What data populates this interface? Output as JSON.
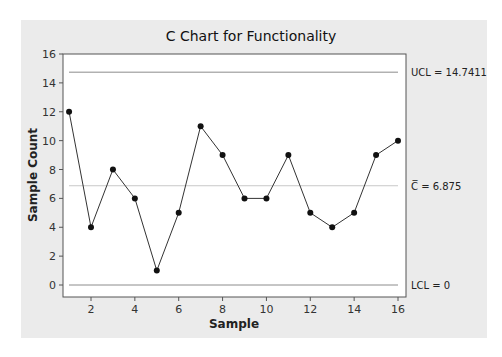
{
  "chart_data": {
    "type": "line",
    "title": "C Chart for Functionality",
    "xlabel": "Sample",
    "ylabel": "Sample Count",
    "x": [
      1,
      2,
      3,
      4,
      5,
      6,
      7,
      8,
      9,
      10,
      11,
      12,
      13,
      14,
      15,
      16
    ],
    "series": [
      {
        "name": "Sample Count",
        "values": [
          12,
          4,
          8,
          6,
          1,
          5,
          11,
          9,
          6,
          6,
          9,
          5,
          4,
          5,
          9,
          10
        ]
      }
    ],
    "xticks": [
      2,
      4,
      6,
      8,
      10,
      12,
      14,
      16
    ],
    "yticks": [
      0,
      2,
      4,
      6,
      8,
      10,
      12,
      14,
      16
    ],
    "ylim": [
      -1.4,
      16
    ],
    "xlim": [
      0.7,
      16.4
    ],
    "control_limits": {
      "UCL": 14.7411,
      "CL": 6.875,
      "LCL": 0
    },
    "annotations": {
      "ucl_label": "UCL=14.7411",
      "cl_label": "C=6.875",
      "lcl_label": "LCL=0"
    },
    "grid": false
  },
  "colors": {
    "panel_bg": "#ebebeb",
    "plot_bg": "#ffffff",
    "line": "#333333",
    "limit_line": "#8c8c8c",
    "center_line": "#c8c8c8"
  }
}
